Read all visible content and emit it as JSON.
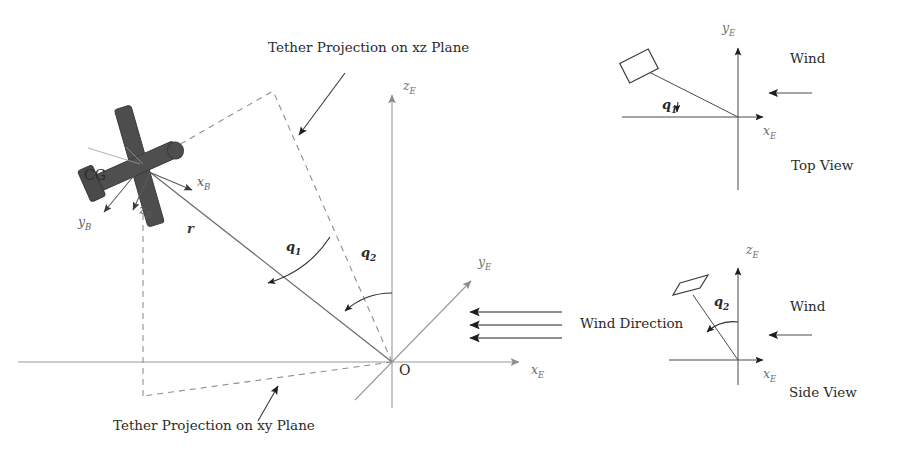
{
  "figure": {
    "background_color": "#ffffff",
    "line_color": "#8c8c8c",
    "dark_line_color": "#4a4a4a",
    "kite_fill_color": "#4d4d4d",
    "text_color": "#2b2b2b"
  },
  "main_view": {
    "origin_label": "O",
    "cg_label": "CG",
    "tether_length_label": "r",
    "axes": [
      {
        "name": "z-earth",
        "label": "z",
        "sub": "E"
      },
      {
        "name": "x-earth",
        "label": "x",
        "sub": "E"
      },
      {
        "name": "y-earth",
        "label": "y",
        "sub": "E"
      }
    ],
    "body_axes": [
      {
        "name": "x-body",
        "label": "x",
        "sub": "B"
      },
      {
        "name": "y-body",
        "label": "y",
        "sub": "B"
      },
      {
        "name": "z-body",
        "label": "z",
        "sub": "B"
      }
    ],
    "angles": [
      {
        "name": "q1",
        "label": "q",
        "sub": "1"
      },
      {
        "name": "q2",
        "label": "q",
        "sub": "2"
      }
    ],
    "annotations": [
      {
        "name": "tether-projection-xz",
        "text": "Tether Projection on xz Plane"
      },
      {
        "name": "tether-projection-xy",
        "text": "Tether Projection on xy Plane"
      },
      {
        "name": "wind-direction",
        "text": "Wind Direction"
      }
    ],
    "wind_arrow_count": 3
  },
  "top_view": {
    "caption": "Top View",
    "wind_label": "Wind",
    "angle": {
      "label": "q",
      "sub": "1"
    },
    "axes": [
      {
        "name": "y-earth",
        "label": "y",
        "sub": "E"
      },
      {
        "name": "x-earth",
        "label": "x",
        "sub": "E"
      }
    ]
  },
  "side_view": {
    "caption": "Side View",
    "wind_label": "Wind",
    "angle": {
      "label": "q",
      "sub": "2"
    },
    "axes": [
      {
        "name": "z-earth",
        "label": "z",
        "sub": "E"
      },
      {
        "name": "x-earth",
        "label": "x",
        "sub": "E"
      }
    ]
  }
}
